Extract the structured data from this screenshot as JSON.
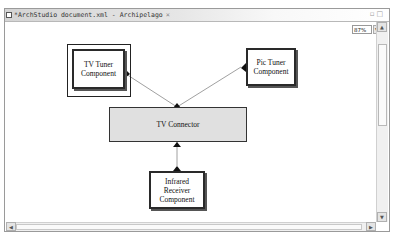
{
  "editor": {
    "tab_title": "*ArchStudio document.xml - Archipelago",
    "tab_close": "×",
    "window_controls": "▫□",
    "zoom_level": "87%"
  },
  "diagram": {
    "components": [
      {
        "id": "tv-tuner",
        "label_line1": "TV Tuner",
        "label_line2": "Component",
        "selected": true
      },
      {
        "id": "pic-tuner",
        "label_line1": "Pic Tuner",
        "label_line2": "Component",
        "selected": false
      },
      {
        "id": "infrared-receiver",
        "label_line1": "Infrared Receiver",
        "label_line2": "Component",
        "selected": false
      }
    ],
    "connectors": [
      {
        "id": "tv-connector",
        "label": "TV Connector"
      }
    ],
    "links": [
      {
        "from": "tv-tuner",
        "to": "tv-connector"
      },
      {
        "from": "pic-tuner",
        "to": "tv-connector"
      },
      {
        "from": "infrared-receiver",
        "to": "tv-connector"
      }
    ]
  },
  "colors": {
    "connector_fill": "#e0e0e0",
    "component_border": "#2a2a2a",
    "edge": "#888888"
  }
}
